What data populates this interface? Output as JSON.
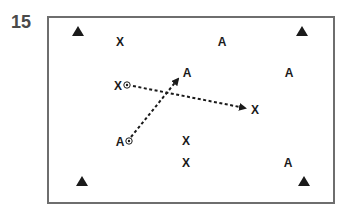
{
  "figure": {
    "number": "15"
  },
  "colors": {
    "ink": "#1a1a1a",
    "border": "#6e6e6e",
    "number": "#4a4a4a"
  },
  "cones": [
    {
      "x": 78,
      "y": 31
    },
    {
      "x": 302,
      "y": 31
    },
    {
      "x": 82,
      "y": 181
    },
    {
      "x": 304,
      "y": 181
    }
  ],
  "players": [
    {
      "label": "X",
      "x": 120,
      "y": 42,
      "has_ball": false
    },
    {
      "label": "A",
      "x": 222,
      "y": 42,
      "has_ball": false
    },
    {
      "label": "X",
      "x": 118,
      "y": 86,
      "has_ball": true
    },
    {
      "label": "A",
      "x": 187,
      "y": 73,
      "has_ball": false
    },
    {
      "label": "A",
      "x": 289,
      "y": 73,
      "has_ball": false
    },
    {
      "label": "X",
      "x": 255,
      "y": 110,
      "has_ball": false
    },
    {
      "label": "A",
      "x": 120,
      "y": 142,
      "has_ball": true
    },
    {
      "label": "X",
      "x": 186,
      "y": 141,
      "has_ball": false
    },
    {
      "label": "X",
      "x": 186,
      "y": 163,
      "has_ball": false
    },
    {
      "label": "A",
      "x": 288,
      "y": 163,
      "has_ball": false
    }
  ],
  "runs": [
    {
      "from": {
        "x": 133,
        "y": 86
      },
      "to": {
        "x": 245,
        "y": 108
      },
      "style": "dashed",
      "arrow": true
    },
    {
      "from": {
        "x": 131,
        "y": 137
      },
      "to": {
        "x": 178,
        "y": 79
      },
      "style": "dashed",
      "arrow": true
    }
  ]
}
